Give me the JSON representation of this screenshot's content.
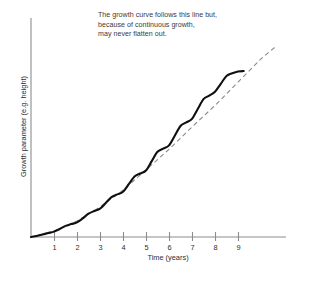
{
  "chart_data": {
    "type": "line",
    "title": "",
    "xlabel": "Time (years)",
    "ylabel": "Growth parameter (e.g. height)",
    "xlim": [
      0,
      11
    ],
    "ylim": [
      0,
      1
    ],
    "grid": false,
    "legend": "none",
    "xticks": [
      "1",
      "2",
      "3",
      "4",
      "5",
      "6",
      "7",
      "8",
      "9"
    ],
    "xtick_values": [
      1,
      2,
      3,
      4,
      5,
      6,
      7,
      8,
      9
    ],
    "yticks": [],
    "annotations": [
      "The growth curve follows this line but,",
      "because of continuous growth,",
      "may never flatten out."
    ],
    "series": [
      {
        "name": "growth curve",
        "style": "solid",
        "color": "#101010",
        "description": "Stepped sigmoid curve with yearly growth spurts and plateaus",
        "x": [
          0.0,
          0.25,
          0.5,
          0.75,
          1.0,
          1.25,
          1.5,
          1.75,
          2.0,
          2.25,
          2.5,
          2.75,
          3.0,
          3.25,
          3.5,
          3.75,
          4.0,
          4.25,
          4.5,
          4.75,
          5.0,
          5.25,
          5.5,
          5.75,
          6.0,
          6.25,
          6.5,
          6.75,
          7.0,
          7.25,
          7.5,
          7.75,
          8.0,
          8.25,
          8.5,
          8.75,
          9.0,
          9.25
        ],
        "y": [
          0.0,
          0.006,
          0.014,
          0.022,
          0.03,
          0.045,
          0.062,
          0.072,
          0.082,
          0.104,
          0.13,
          0.145,
          0.158,
          0.19,
          0.223,
          0.238,
          0.253,
          0.295,
          0.338,
          0.355,
          0.372,
          0.424,
          0.476,
          0.494,
          0.512,
          0.566,
          0.62,
          0.64,
          0.66,
          0.715,
          0.77,
          0.79,
          0.812,
          0.856,
          0.9,
          0.915,
          0.925,
          0.927
        ]
      },
      {
        "name": "trend line",
        "style": "dashed",
        "color": "#8a8a8a",
        "description": "Smooth sigmoid reference line extending past the curve",
        "x": [
          0.0,
          0.5,
          1.0,
          1.5,
          2.0,
          2.5,
          3.0,
          3.5,
          4.0,
          4.5,
          5.0,
          5.5,
          6.0,
          6.5,
          7.0,
          7.5,
          8.0,
          8.5,
          9.0,
          9.5,
          10.0,
          10.6
        ],
        "y": [
          0.0,
          0.016,
          0.034,
          0.06,
          0.09,
          0.128,
          0.168,
          0.215,
          0.262,
          0.318,
          0.375,
          0.432,
          0.49,
          0.552,
          0.615,
          0.675,
          0.735,
          0.8,
          0.865,
          0.93,
          0.995,
          1.06
        ]
      }
    ]
  },
  "axis": {
    "line_color": "#8c8c8c",
    "tick_color": "#8c8c8c"
  }
}
